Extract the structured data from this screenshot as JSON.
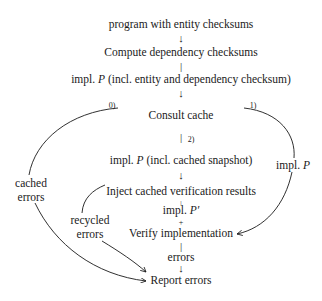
{
  "nodes": {
    "program": "program with entity checksums",
    "compute": "Compute dependency checksums",
    "impl_full_prefix": "impl. ",
    "impl_full_var": "P",
    "impl_full_suffix": " (incl. entity and dependency checksum)",
    "consult": "Consult cache",
    "impl_snapshot_prefix": "impl. ",
    "impl_snapshot_var": "P",
    "impl_snapshot_suffix": " (incl. cached snapshot)",
    "inject": "Inject cached verification results",
    "impl_prime_prefix": "impl. ",
    "impl_prime_var": "P′",
    "verify": "Verify implementation",
    "errors": "errors",
    "report": "Report errors"
  },
  "side_labels": {
    "cached_line1": "cached",
    "cached_line2": "errors",
    "recycled_line1": "recycled",
    "recycled_line2": "errors",
    "impl_right_prefix": "impl. ",
    "impl_right_var": "P"
  },
  "branch_labels": {
    "zero": "0)",
    "one": "1)",
    "two": "2)"
  },
  "glyphs": {
    "down_arrow": "↓",
    "bar": "|",
    "tick_arrow": "+"
  }
}
